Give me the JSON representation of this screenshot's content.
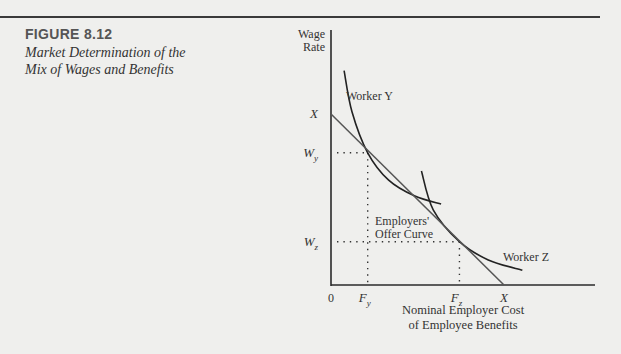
{
  "figure": {
    "label": "FIGURE 8.12",
    "title_line1": "Market Determination of the",
    "title_line2": "Mix of Wages and Benefits"
  },
  "chart_data": {
    "type": "line",
    "title": "Market Determination of the Mix of Wages and Benefits",
    "ylabel_line1": "Wage",
    "ylabel_line2": "Rate",
    "xlabel_line1": "Nominal Employer Cost",
    "xlabel_line2": "of Employee Benefits",
    "origin_label": "0",
    "y_ticks": [
      {
        "label": "X",
        "sub": "",
        "value": 0.75
      },
      {
        "label": "W",
        "sub": "y",
        "value": 0.58
      },
      {
        "label": "W",
        "sub": "z",
        "value": 0.19
      }
    ],
    "x_ticks": [
      {
        "label": "F",
        "sub": "y",
        "value": 0.14
      },
      {
        "label": "F",
        "sub": "z",
        "value": 0.49
      },
      {
        "label": "X",
        "sub": "",
        "value": 0.66
      }
    ],
    "xlim": [
      0,
      1
    ],
    "ylim": [
      0,
      1
    ],
    "series": [
      {
        "name": "Worker Y",
        "label": "Worker Y",
        "kind": "indifference-curve",
        "points": [
          [
            0.05,
            0.94
          ],
          [
            0.08,
            0.76
          ],
          [
            0.14,
            0.58
          ],
          [
            0.22,
            0.46
          ],
          [
            0.32,
            0.39
          ],
          [
            0.42,
            0.355
          ]
        ]
      },
      {
        "name": "Worker Z",
        "label": "Worker Z",
        "kind": "indifference-curve",
        "points": [
          [
            0.345,
            0.5
          ],
          [
            0.39,
            0.33
          ],
          [
            0.49,
            0.19
          ],
          [
            0.6,
            0.11
          ],
          [
            0.73,
            0.065
          ]
        ]
      },
      {
        "name": "Employers' Offer Curve",
        "label_line1": "Employers'",
        "label_line2": "Offer Curve",
        "kind": "line",
        "points": [
          [
            0.0,
            0.75
          ],
          [
            0.66,
            0.0
          ]
        ]
      }
    ],
    "guides": [
      {
        "from": "Wy",
        "x": 0.14,
        "y": 0.58
      },
      {
        "from": "Wz",
        "x": 0.49,
        "y": 0.19
      }
    ],
    "grid": false,
    "legend": "none"
  }
}
